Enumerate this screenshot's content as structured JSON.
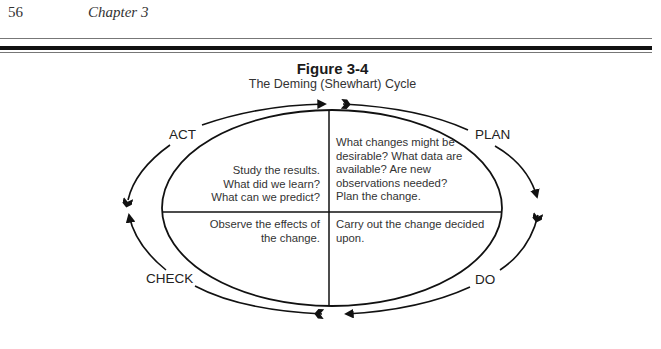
{
  "header": {
    "page_number": "56",
    "chapter": "Chapter 3"
  },
  "figure": {
    "title": "Figure 3-4",
    "subtitle": "The Deming (Shewhart) Cycle"
  },
  "cycle": {
    "stages": [
      {
        "id": "plan",
        "label": "PLAN"
      },
      {
        "id": "do",
        "label": "DO"
      },
      {
        "id": "check",
        "label": "CHECK"
      },
      {
        "id": "act",
        "label": "ACT"
      }
    ],
    "quadrants": {
      "top_left": [
        "Study the results.",
        "What did we learn?",
        "What can we predict?"
      ],
      "top_right": [
        "What changes might be",
        "desirable? What data are",
        "available? Are new",
        "observations needed?",
        "Plan the change."
      ],
      "bottom_left": [
        "Observe the effects of",
        "the change."
      ],
      "bottom_right": [
        "Carry out the change decided",
        "upon."
      ]
    },
    "direction": "clockwise"
  }
}
